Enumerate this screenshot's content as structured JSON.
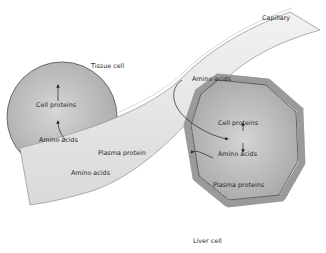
{
  "diagram": {
    "title": "",
    "labels": {
      "capillary": "Capillary",
      "tissue_cell": "Tissue cell",
      "liver_cell": "Liver cell",
      "tissue_cell_proteins": "Cell proteins",
      "tissue_amino_acids": "Amino acids",
      "capillary_amino_acids_left": "Amino acids",
      "plasma_protein": "Plasma protein",
      "capillary_amino_acids_top": "Amino acids",
      "liver_cell_proteins": "Cell proteins",
      "liver_amino_acids": "Amino acids",
      "liver_plasma_proteins": "Plasma proteins"
    },
    "nodes": [
      {
        "id": "tissue_cell",
        "label": "Tissue cell",
        "shape": "circle"
      },
      {
        "id": "capillary",
        "label": "Capillary",
        "shape": "tube"
      },
      {
        "id": "liver_cell",
        "label": "Liver cell",
        "shape": "octagon-with-microvilli"
      }
    ],
    "edges": [
      {
        "from": "Amino acids (capillary)",
        "to": "Amino acids (tissue cell)"
      },
      {
        "from": "Amino acids (tissue cell)",
        "to": "Cell proteins (tissue cell)"
      },
      {
        "from": "Amino acids (capillary)",
        "to": "Amino acids (liver cell)"
      },
      {
        "from": "Amino acids (liver cell)",
        "to": "Cell proteins (liver cell)",
        "bidirectional": true
      },
      {
        "from": "Amino acids (liver cell)",
        "to": "Plasma proteins (liver cell)"
      },
      {
        "from": "Plasma proteins (liver cell)",
        "to": "Plasma protein (capillary)"
      }
    ],
    "colors": {
      "cell_fill": "#c9c9c9",
      "cell_edge": "#6a6a6a",
      "capillary_fill": "#e6e6e6",
      "capillary_edge": "#9a9a9a",
      "text": "#2a2a2a"
    }
  }
}
